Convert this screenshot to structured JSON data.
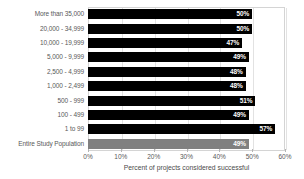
{
  "chart_data": {
    "type": "bar",
    "orientation": "horizontal",
    "title": "",
    "xlabel": "Percent of projects considered successful",
    "ylabel": "",
    "xlim": [
      0,
      60
    ],
    "grid": true,
    "legend": "none",
    "xticks": [
      "0%",
      "10%",
      "20%",
      "30%",
      "40%",
      "50%",
      "60%"
    ],
    "xtick_values": [
      0,
      10,
      20,
      30,
      40,
      50,
      60
    ],
    "categories": [
      "More than 35,000",
      "20,000 - 34,999",
      "10,000 - 19,999",
      "5,000 - 9,999",
      "2,500 - 4,999",
      "1,000 - 2,499",
      "500 - 999",
      "100 - 499",
      "1 to 99",
      "Entire Study Population"
    ],
    "values": [
      50,
      50,
      47,
      49,
      48,
      48,
      51,
      49,
      57,
      49
    ],
    "data_labels": [
      "50%",
      "50%",
      "47%",
      "49%",
      "48%",
      "48%",
      "51%",
      "49%",
      "57%",
      "49%"
    ],
    "bar_colors": [
      "#000000",
      "#000000",
      "#000000",
      "#000000",
      "#000000",
      "#000000",
      "#000000",
      "#000000",
      "#000000",
      "#808080"
    ],
    "data_label_color": "#ffffff",
    "axis_color": "#d4d4d4",
    "grid_color": "#e2e2e2",
    "background": "#ffffff"
  }
}
